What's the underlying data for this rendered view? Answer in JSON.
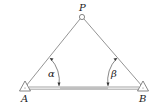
{
  "diagram": {
    "type": "surveying forward intersection",
    "points": {
      "P": {
        "label": "P",
        "symbol": "circle"
      },
      "A": {
        "label": "A",
        "symbol": "triangle"
      },
      "B": {
        "label": "B",
        "symbol": "triangle"
      }
    },
    "angles": {
      "alpha": {
        "label": "α",
        "at": "A"
      },
      "beta": {
        "label": "β",
        "at": "B"
      }
    },
    "colors": {
      "stroke": "#555555",
      "background": "#ffffff"
    }
  }
}
